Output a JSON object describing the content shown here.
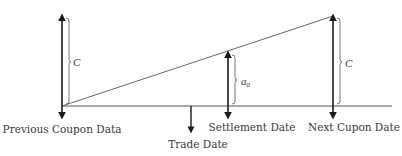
{
  "diagram": {
    "type": "accrued-interest-timeline",
    "colors": {
      "ink": "#1a1a1a",
      "line": "#555555",
      "text": "#3a3a3a"
    },
    "labels": {
      "previous_coupon": "Previous Coupon Data",
      "trade_date": "Trade Date",
      "settlement_date": "Settlement Date",
      "next_coupon": "Next Cupon Date"
    },
    "braces": {
      "left_c": "C",
      "right_c": "C",
      "accrued": "a",
      "accrued_sub": "0"
    }
  }
}
